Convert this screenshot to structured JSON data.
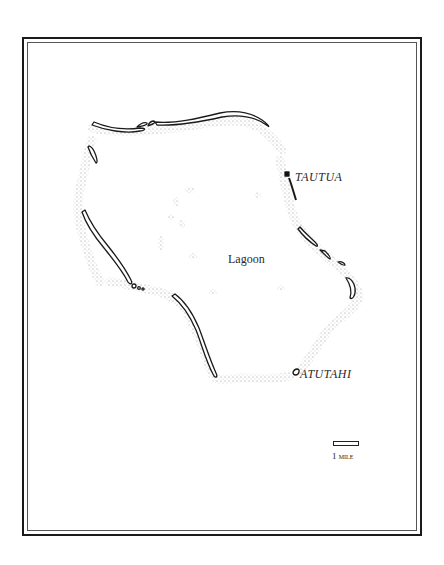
{
  "map": {
    "water_label": "Lagoon",
    "places": [
      {
        "name": "TAUTUA"
      },
      {
        "name": "ATUTAHI"
      }
    ],
    "scale": {
      "number": "1",
      "unit": "mile"
    },
    "colors": {
      "ink": "#1a1a1a",
      "reef_stipple": "#9a9a9a",
      "background": "#ffffff"
    }
  }
}
